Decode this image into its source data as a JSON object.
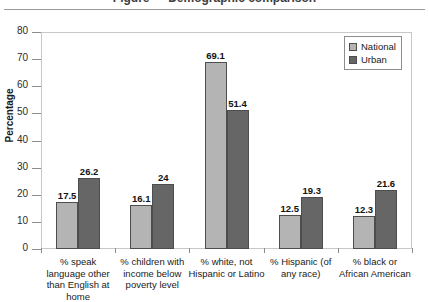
{
  "caption": {
    "text": "Figure — Demographic comparison"
  },
  "chart_data": {
    "type": "bar",
    "title": "",
    "xlabel": "",
    "ylabel": "Percentage",
    "ylim": [
      0,
      80
    ],
    "yticks": [
      0,
      10,
      20,
      30,
      40,
      50,
      60,
      70,
      80
    ],
    "grid": false,
    "legend_position": "top-right",
    "categories": [
      "% speak\nlanguage other\nthan English at home",
      "% children with\nincome below\npoverty level",
      "% white, not\nHispanic or Latino",
      "% Hispanic (of\nany race)",
      "% black or\nAfrican American"
    ],
    "category_lines": [
      [
        "% speak",
        "language other",
        "than English at home"
      ],
      [
        "% children with",
        "income below",
        "poverty level"
      ],
      [
        "% white, not",
        "Hispanic or Latino"
      ],
      [
        "% Hispanic (of",
        "any race)"
      ],
      [
        "% black or",
        "African American"
      ]
    ],
    "series": [
      {
        "name": "National",
        "color": "#b4b4b4",
        "values": [
          17.5,
          16.1,
          69.1,
          12.5,
          12.3
        ],
        "labels": [
          "17.5",
          "16.1",
          "69.1",
          "12.5",
          "12.3"
        ]
      },
      {
        "name": "Urban",
        "color": "#666666",
        "values": [
          26.2,
          24,
          51.4,
          19.3,
          21.6
        ],
        "labels": [
          "26.2",
          "24",
          "51.4",
          "19.3",
          "21.6"
        ]
      }
    ]
  },
  "axis": {
    "y_labels": [
      "80",
      "70",
      "60",
      "50",
      "40",
      "30",
      "20",
      "10",
      "0"
    ],
    "y_title": "Percentage"
  },
  "legend": {
    "items": [
      {
        "label": "National"
      },
      {
        "label": "Urban"
      }
    ]
  }
}
